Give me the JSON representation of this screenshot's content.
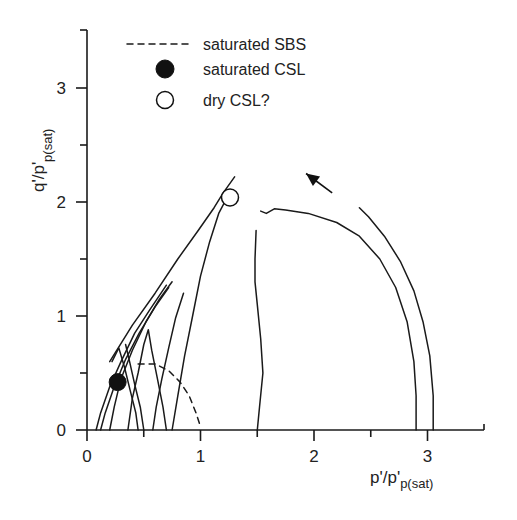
{
  "chart_data": {
    "type": "line",
    "title": "",
    "xlabel": "p'/p'",
    "xlabel_sub": "p(sat)",
    "ylabel": "q'/p'",
    "ylabel_sub": "p(sat)",
    "xlim": [
      0,
      3.5
    ],
    "ylim": [
      0,
      3.5
    ],
    "x_ticks": [
      0,
      0.5,
      1,
      1.5,
      2,
      2.5,
      3
    ],
    "x_tick_labels": [
      "0",
      "",
      "1",
      "",
      "2",
      "",
      "3"
    ],
    "y_ticks": [
      0,
      0.5,
      1,
      1.5,
      2,
      2.5,
      3
    ],
    "y_tick_labels": [
      "0",
      "",
      "1",
      "",
      "2",
      "",
      "3"
    ],
    "grid": false,
    "legend_position": "top-center",
    "legend": [
      {
        "label": "saturated SBS",
        "marker": "dashed-line"
      },
      {
        "label": "saturated CSL",
        "marker": "filled-circle"
      },
      {
        "label": "dry CSL?",
        "marker": "open-circle"
      }
    ],
    "series": [
      {
        "name": "stress path A (p0=0.1)",
        "style": "solid",
        "points": [
          [
            0.08,
            0
          ],
          [
            0.12,
            0.15
          ],
          [
            0.2,
            0.38
          ],
          [
            0.3,
            0.6
          ],
          [
            0.42,
            0.85
          ],
          [
            0.55,
            1.05
          ],
          [
            0.7,
            1.27
          ]
        ]
      },
      {
        "name": "stress path B (p0=0.15)",
        "style": "solid",
        "points": [
          [
            0.12,
            0
          ],
          [
            0.16,
            0.15
          ],
          [
            0.24,
            0.38
          ],
          [
            0.34,
            0.62
          ],
          [
            0.46,
            0.85
          ],
          [
            0.6,
            1.08
          ],
          [
            0.72,
            1.25
          ]
        ]
      },
      {
        "name": "stress path C (p0=0.22)",
        "style": "solid",
        "points": [
          [
            0.2,
            0
          ],
          [
            0.24,
            0.2
          ],
          [
            0.3,
            0.45
          ],
          [
            0.4,
            0.7
          ],
          [
            0.52,
            0.95
          ],
          [
            0.64,
            1.15
          ],
          [
            0.75,
            1.3
          ]
        ]
      },
      {
        "name": "stress path D (p0=0.45)",
        "style": "solid",
        "points": [
          [
            0.45,
            0
          ],
          [
            0.43,
            0.15
          ],
          [
            0.38,
            0.35
          ],
          [
            0.33,
            0.55
          ],
          [
            0.28,
            0.72
          ],
          [
            0.22,
            0.6
          ]
        ]
      },
      {
        "name": "stress path E (p0=0.5)",
        "style": "solid",
        "points": [
          [
            0.5,
            0
          ],
          [
            0.47,
            0.2
          ],
          [
            0.42,
            0.4
          ],
          [
            0.38,
            0.58
          ],
          [
            0.34,
            0.75
          ]
        ]
      },
      {
        "name": "stress path F (p0=0.7)",
        "style": "solid",
        "points": [
          [
            0.7,
            0
          ],
          [
            0.67,
            0.2
          ],
          [
            0.62,
            0.45
          ],
          [
            0.57,
            0.7
          ],
          [
            0.54,
            0.88
          ],
          [
            0.5,
            0.75
          ],
          [
            0.45,
            0.5
          ],
          [
            0.4,
            0.28
          ],
          [
            0.36,
            0
          ]
        ]
      },
      {
        "name": "stress path G (p0=0.6)",
        "style": "solid",
        "points": [
          [
            0.58,
            0
          ],
          [
            0.61,
            0.2
          ],
          [
            0.66,
            0.45
          ],
          [
            0.72,
            0.72
          ],
          [
            0.78,
            0.98
          ],
          [
            0.85,
            1.2
          ]
        ]
      },
      {
        "name": "stress path H (p0=0.75)",
        "style": "solid",
        "points": [
          [
            0.75,
            0
          ],
          [
            0.8,
            0.3
          ],
          [
            0.86,
            0.65
          ],
          [
            0.93,
            1.0
          ],
          [
            1.0,
            1.35
          ],
          [
            1.08,
            1.65
          ],
          [
            1.16,
            1.9
          ],
          [
            1.24,
            2.05
          ]
        ]
      },
      {
        "name": "dry upper path",
        "style": "solid",
        "points": [
          [
            0.2,
            0.6
          ],
          [
            0.4,
            0.92
          ],
          [
            0.6,
            1.2
          ],
          [
            0.8,
            1.5
          ],
          [
            0.98,
            1.75
          ],
          [
            1.12,
            1.95
          ],
          [
            1.2,
            2.08
          ],
          [
            1.3,
            2.22
          ]
        ]
      },
      {
        "name": "dry path (p0=1.5)",
        "style": "solid",
        "points": [
          [
            1.5,
            0
          ],
          [
            1.52,
            0.2
          ],
          [
            1.55,
            0.5
          ],
          [
            1.53,
            0.8
          ],
          [
            1.5,
            1.1
          ],
          [
            1.48,
            1.3
          ],
          [
            1.48,
            1.5
          ],
          [
            1.49,
            1.75
          ]
        ]
      },
      {
        "name": "dry path (p0=2.9)",
        "style": "solid",
        "points": [
          [
            2.9,
            0
          ],
          [
            2.9,
            0.3
          ],
          [
            2.88,
            0.6
          ],
          [
            2.82,
            0.95
          ],
          [
            2.72,
            1.25
          ],
          [
            2.58,
            1.5
          ],
          [
            2.4,
            1.7
          ],
          [
            2.2,
            1.82
          ],
          [
            1.95,
            1.9
          ],
          [
            1.75,
            1.93
          ],
          [
            1.65,
            1.94
          ],
          [
            1.58,
            1.9
          ],
          [
            1.53,
            1.92
          ]
        ]
      },
      {
        "name": "dry path (p0=3.05)",
        "style": "solid",
        "points": [
          [
            3.05,
            0
          ],
          [
            3.05,
            0.3
          ],
          [
            3.02,
            0.65
          ],
          [
            2.96,
            0.95
          ],
          [
            2.88,
            1.22
          ],
          [
            2.76,
            1.48
          ],
          [
            2.62,
            1.7
          ],
          [
            2.48,
            1.87
          ],
          [
            2.4,
            1.95
          ]
        ]
      },
      {
        "name": "saturated SBS",
        "style": "dashed",
        "points": [
          [
            0.45,
            0.58
          ],
          [
            0.6,
            0.58
          ],
          [
            0.72,
            0.52
          ],
          [
            0.82,
            0.42
          ],
          [
            0.9,
            0.3
          ],
          [
            0.96,
            0.15
          ],
          [
            1.0,
            0.03
          ]
        ]
      }
    ],
    "markers": [
      {
        "type": "filled-circle",
        "label": "saturated CSL",
        "x": 0.27,
        "y": 0.42
      },
      {
        "type": "open-circle",
        "label": "dry CSL?",
        "x": 1.26,
        "y": 2.04
      }
    ],
    "annotations": [
      {
        "type": "arrow",
        "from": [
          2.16,
          2.08
        ],
        "to": [
          1.93,
          2.25
        ],
        "meaning": "loading direction"
      }
    ]
  }
}
